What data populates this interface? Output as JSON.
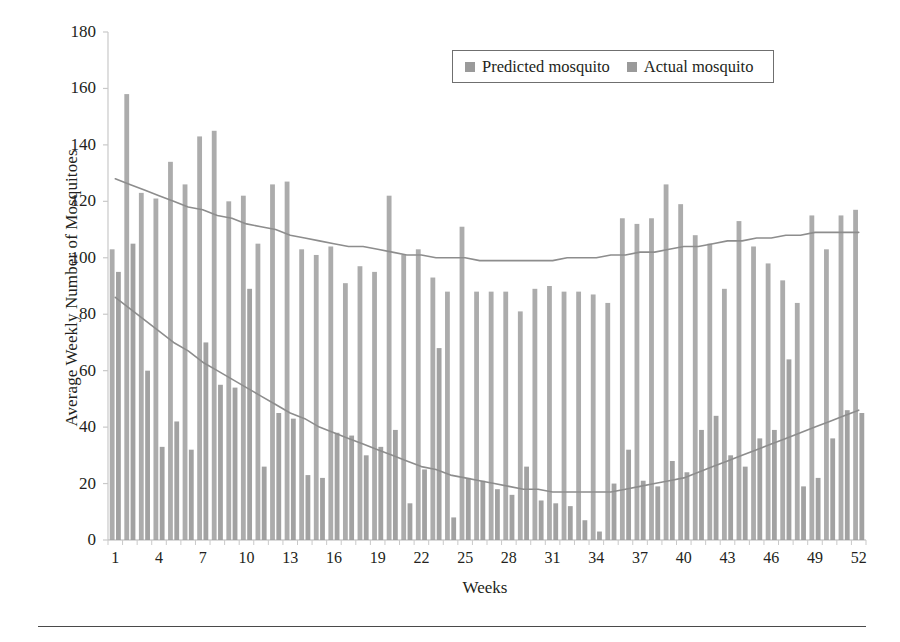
{
  "chart_data": {
    "type": "bar",
    "title": "",
    "xlabel": "Weeks",
    "ylabel": "Average Weekly Number of Mosquitoes",
    "xlim": [
      0.5,
      52.5
    ],
    "ylim": [
      0,
      180
    ],
    "yticks": [
      0,
      20,
      40,
      60,
      80,
      100,
      120,
      140,
      160,
      180
    ],
    "xticks": [
      1,
      4,
      7,
      10,
      13,
      16,
      19,
      22,
      25,
      28,
      31,
      34,
      37,
      40,
      43,
      46,
      49,
      52
    ],
    "grid": false,
    "legend_position": "top-right",
    "categories": [
      1,
      2,
      3,
      4,
      5,
      6,
      7,
      8,
      9,
      10,
      11,
      12,
      13,
      14,
      15,
      16,
      17,
      18,
      19,
      20,
      21,
      22,
      23,
      24,
      25,
      26,
      27,
      28,
      29,
      30,
      31,
      32,
      33,
      34,
      35,
      36,
      37,
      38,
      39,
      40,
      41,
      42,
      43,
      44,
      45,
      46,
      47,
      48,
      49,
      50,
      51,
      52
    ],
    "series": [
      {
        "name": "Predicted mosquito",
        "color": "#9a9a9a",
        "values": [
          103,
          158,
          123,
          121,
          134,
          126,
          143,
          145,
          120,
          122,
          105,
          126,
          127,
          103,
          101,
          104,
          91,
          97,
          95,
          122,
          101,
          103,
          93,
          88,
          111,
          88,
          88,
          88,
          81,
          89,
          90,
          88,
          88,
          87,
          84,
          114,
          112,
          114,
          126,
          119,
          108,
          105,
          89,
          113,
          104,
          98,
          92,
          84,
          115,
          103,
          115,
          117
        ]
      },
      {
        "name": "Actual mosquito",
        "color": "#9a9a9a",
        "values": [
          95,
          105,
          60,
          33,
          42,
          32,
          70,
          55,
          54,
          89,
          26,
          45,
          43,
          23,
          22,
          38,
          37,
          30,
          33,
          39,
          13,
          25,
          68,
          8,
          22,
          21,
          18,
          16,
          26,
          14,
          13,
          12,
          7,
          3,
          20,
          32,
          21,
          19,
          28,
          24,
          39,
          44,
          30,
          26,
          36,
          39,
          64,
          19,
          22,
          36,
          46,
          45
        ]
      }
    ],
    "trendlines": [
      {
        "name": "Predicted mosquito trend",
        "color": "#8d8d8d",
        "points_y": [
          128,
          126,
          124,
          122,
          120,
          118,
          117,
          115,
          114,
          112,
          111,
          110,
          108,
          107,
          106,
          105,
          104,
          104,
          103,
          102,
          101,
          101,
          100,
          100,
          100,
          99,
          99,
          99,
          99,
          99,
          99,
          100,
          100,
          100,
          101,
          101,
          102,
          102,
          103,
          104,
          104,
          105,
          106,
          106,
          107,
          107,
          108,
          108,
          109,
          109,
          109,
          109
        ]
      },
      {
        "name": "Actual mosquito trend",
        "color": "#8d8d8d",
        "points_y": [
          86,
          82,
          78,
          74,
          70,
          67,
          63,
          60,
          57,
          54,
          51,
          48,
          45,
          43,
          40,
          38,
          36,
          34,
          32,
          30,
          28,
          26,
          25,
          23,
          22,
          21,
          20,
          19,
          18,
          18,
          17,
          17,
          17,
          17,
          17,
          18,
          19,
          20,
          21,
          22,
          24,
          26,
          28,
          30,
          32,
          34,
          36,
          38,
          40,
          42,
          44,
          46
        ]
      }
    ]
  },
  "legend": {
    "items": [
      {
        "label": "Predicted mosquito"
      },
      {
        "label": "Actual mosquito"
      }
    ]
  }
}
